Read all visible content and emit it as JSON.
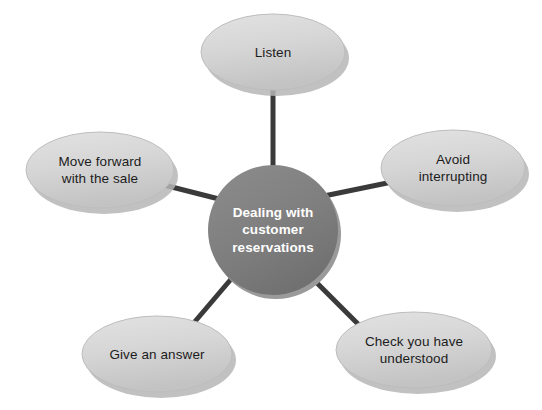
{
  "diagram": {
    "type": "spider-hub-and-spoke",
    "background_color": "#ffffff",
    "center": {
      "name": "center-node",
      "text": "Dealing with\ncustomer\nreservations",
      "shape": "circle",
      "fill_color": "#808080",
      "text_color": "#ffffff",
      "cx": 273,
      "cy": 230,
      "r": 65
    },
    "connector": {
      "color": "#3a3a3a",
      "width": 5
    },
    "nodes": [
      {
        "name": "node-listen",
        "text": "Listen",
        "shape": "ellipse",
        "fill_color": "#d4d4d4",
        "text_color": "#1c1c1c",
        "cx": 273,
        "cy": 52,
        "rx": 72,
        "ry": 38
      },
      {
        "name": "node-avoid-interrupting",
        "text": "Avoid\ninterrupting",
        "shape": "ellipse",
        "fill_color": "#d4d4d4",
        "text_color": "#1c1c1c",
        "cx": 453,
        "cy": 168,
        "rx": 72,
        "ry": 38
      },
      {
        "name": "node-check-you-have-understood",
        "text": "Check you have\nunderstood",
        "shape": "ellipse",
        "fill_color": "#d4d4d4",
        "text_color": "#1c1c1c",
        "cx": 414,
        "cy": 350,
        "rx": 78,
        "ry": 38
      },
      {
        "name": "node-give-an-answer",
        "text": "Give an answer",
        "shape": "ellipse",
        "fill_color": "#d4d4d4",
        "text_color": "#1c1c1c",
        "cx": 157,
        "cy": 354,
        "rx": 75,
        "ry": 38
      },
      {
        "name": "node-move-forward-with-the-sale",
        "text": "Move forward\nwith the sale",
        "shape": "ellipse",
        "fill_color": "#d4d4d4",
        "text_color": "#1c1c1c",
        "cx": 100,
        "cy": 170,
        "rx": 74,
        "ry": 38
      }
    ],
    "edges": [
      {
        "name": "edge-center-to-listen",
        "x1": 273,
        "y1": 176,
        "x2": 273,
        "y2": 88
      },
      {
        "name": "edge-center-to-avoid",
        "x1": 324,
        "y1": 196,
        "x2": 392,
        "y2": 182
      },
      {
        "name": "edge-center-to-check",
        "x1": 312,
        "y1": 278,
        "x2": 364,
        "y2": 330
      },
      {
        "name": "edge-center-to-give",
        "x1": 232,
        "y1": 278,
        "x2": 192,
        "y2": 325
      },
      {
        "name": "edge-center-to-move",
        "x1": 219,
        "y1": 199,
        "x2": 160,
        "y2": 184
      }
    ]
  }
}
